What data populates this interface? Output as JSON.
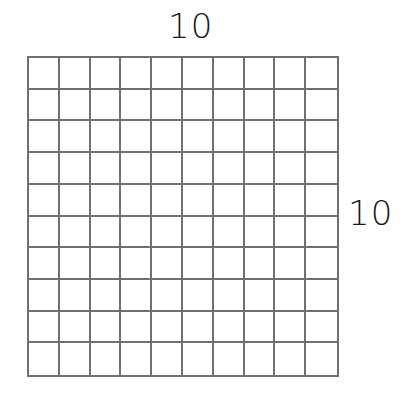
{
  "diagram": {
    "type": "hundred-grid",
    "top_label": "10",
    "right_label": "10",
    "rows": 10,
    "columns": 10,
    "line_color": "#707070",
    "background": "#ffffff"
  }
}
